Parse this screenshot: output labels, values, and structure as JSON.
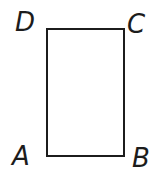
{
  "diagram": {
    "type": "rectangle",
    "vertices": [
      {
        "label": "D",
        "position": "top-left"
      },
      {
        "label": "C",
        "position": "top-right"
      },
      {
        "label": "A",
        "position": "bottom-left"
      },
      {
        "label": "B",
        "position": "bottom-right"
      }
    ],
    "colors": {
      "stroke": "#1c1c1c",
      "background": "#ffffff",
      "label_text": "#1c1c1c"
    }
  }
}
